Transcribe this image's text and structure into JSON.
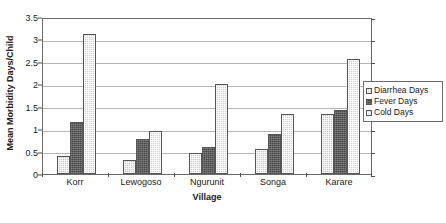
{
  "chart_data": {
    "type": "bar",
    "title": "",
    "subtitle": "",
    "xlabel": "Village",
    "ylabel": "Mean Morbidity Days/Child",
    "categories": [
      "Korr",
      "Lewogoso",
      "Ngurunit",
      "Songa",
      "Karare"
    ],
    "series": [
      {
        "name": "Diarrhea Days",
        "values": [
          0.4,
          0.32,
          0.47,
          0.56,
          1.33
        ],
        "color": "#c8c8c8"
      },
      {
        "name": "Fever Days",
        "values": [
          1.17,
          0.79,
          0.6,
          0.9,
          1.42
        ],
        "color": "#474747"
      },
      {
        "name": "Cold Days",
        "values": [
          3.13,
          0.96,
          2.0,
          1.33,
          2.56
        ],
        "color": "#cfcfcf"
      }
    ],
    "ylim": [
      0,
      3.5
    ],
    "yticks": [
      0,
      0.5,
      1,
      1.5,
      2,
      2.5,
      3,
      3.5
    ],
    "ytick_labels": [
      "0",
      "0.5",
      "1",
      "1.5",
      "2",
      "2.5",
      "3",
      "3.5"
    ],
    "grid": true,
    "grid_axis": "y",
    "legend_position": "right",
    "annotations": []
  },
  "legend": {
    "entries": [
      {
        "label": "Diarrhea Days"
      },
      {
        "label": "Fever Days"
      },
      {
        "label": "Cold Days"
      }
    ]
  }
}
